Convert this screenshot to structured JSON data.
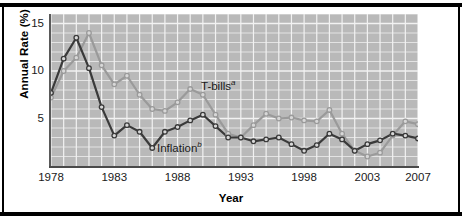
{
  "axes": {
    "ylabel": "Annual Rate (%)",
    "xlabel": "Year",
    "yticks": [
      "5",
      "10",
      "15"
    ],
    "xticks": [
      "1978",
      "1983",
      "1988",
      "1993",
      "1998",
      "2003",
      "2007"
    ]
  },
  "labels": {
    "tbills": "T-bills",
    "tbills_note": "a",
    "inflation": "Inflation",
    "inflation_note": "b"
  },
  "colors": {
    "plot_background": "#b9b9b9",
    "gridline": "#f2f2f2",
    "tbills_line": "#9a9a9a",
    "inflation_line": "#3a3a3a",
    "frame": "#000000",
    "marker_fill": "#d8d8d8"
  },
  "chart_data": {
    "type": "line",
    "title": "",
    "xlabel": "Year",
    "ylabel": "Annual Rate (%)",
    "xlim": [
      1978,
      2007
    ],
    "ylim": [
      0,
      16
    ],
    "yticks": [
      5,
      10,
      15
    ],
    "xticks": [
      1978,
      1983,
      1988,
      1993,
      1998,
      2003,
      2007
    ],
    "grid": true,
    "legend": "inline-annotation",
    "x": [
      1978,
      1979,
      1980,
      1981,
      1982,
      1983,
      1984,
      1985,
      1986,
      1987,
      1988,
      1989,
      1990,
      1991,
      1992,
      1993,
      1994,
      1995,
      1996,
      1997,
      1998,
      1999,
      2000,
      2001,
      2002,
      2003,
      2004,
      2005,
      2006,
      2007
    ],
    "series": [
      {
        "name": "T-bills",
        "note": "a",
        "color": "#9a9a9a",
        "values": [
          7.2,
          10.0,
          11.4,
          14.0,
          10.6,
          8.6,
          9.5,
          7.5,
          6.0,
          5.8,
          6.7,
          8.1,
          7.5,
          5.4,
          3.4,
          3.0,
          4.3,
          5.5,
          5.0,
          5.1,
          4.8,
          4.7,
          5.9,
          3.4,
          1.6,
          1.0,
          1.4,
          3.2,
          4.7,
          4.4
        ]
      },
      {
        "name": "Inflation",
        "note": "b",
        "color": "#3a3a3a",
        "values": [
          7.7,
          11.3,
          13.5,
          10.3,
          6.2,
          3.2,
          4.3,
          3.6,
          1.9,
          3.6,
          4.1,
          4.8,
          5.4,
          4.2,
          3.0,
          3.0,
          2.6,
          2.8,
          3.0,
          2.3,
          1.6,
          2.2,
          3.4,
          2.8,
          1.6,
          2.3,
          2.7,
          3.4,
          3.2,
          2.9
        ]
      }
    ]
  }
}
